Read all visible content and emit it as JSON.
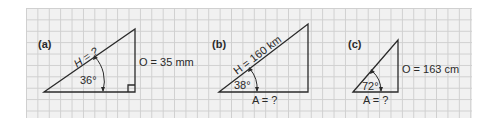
{
  "figure": {
    "background": "#f1f1f1",
    "grid_color": "#cfcfcf",
    "line_color": "#2a2a2a",
    "panels": [
      {
        "id": "a",
        "label": "(a)",
        "hypotenuse_label": "H = ?",
        "opposite_label": "O = 35 mm",
        "adjacent_label": "",
        "angle_label": "36°",
        "right_angle_marker": true
      },
      {
        "id": "b",
        "label": "(b)",
        "hypotenuse_label": "H = 160 km",
        "opposite_label": "",
        "adjacent_label": "A = ?",
        "angle_label": "38°",
        "right_angle_marker": false
      },
      {
        "id": "c",
        "label": "(c)",
        "hypotenuse_label": "",
        "opposite_label": "O = 163 cm",
        "adjacent_label": "A = ?",
        "angle_label": "72°",
        "right_angle_marker": false
      }
    ]
  }
}
